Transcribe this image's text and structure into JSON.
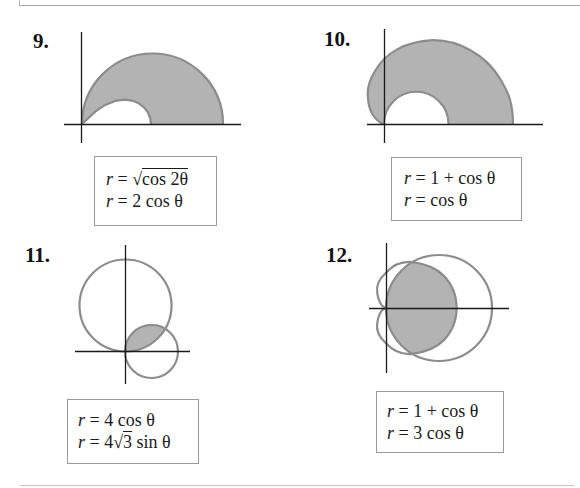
{
  "page": {
    "type": "textbook exercise figures: area between polar curves",
    "colors": {
      "curve": "#8c8c8c",
      "shading": "#b3b3b3",
      "axis": "#1a1a1a",
      "box_border": "#9a9a9a"
    }
  },
  "problems": [
    {
      "number": "9.",
      "equations": [
        {
          "lhs": "r",
          "eq": " = ",
          "pre": "",
          "radicand": "cos 2θ",
          "post": ""
        },
        {
          "lhs": "r",
          "eq": " = ",
          "text": "2 cos θ"
        }
      ],
      "figure": "shaded region inside r = 2cosθ, outside r = √cos2θ, upper half-plane"
    },
    {
      "number": "10.",
      "equations": [
        {
          "lhs": "r",
          "eq": " = ",
          "text": "1 + cos θ"
        },
        {
          "lhs": "r",
          "eq": " = ",
          "text": "cos θ"
        }
      ],
      "figure": "shaded region inside cardioid r = 1 + cosθ, outside r = cosθ, upper half-plane"
    },
    {
      "number": "11.",
      "equations": [
        {
          "lhs": "r",
          "eq": " = ",
          "text": "4 cos θ"
        },
        {
          "lhs": "r",
          "eq": " = ",
          "pre": "4",
          "radicand": "3",
          "post": " sin θ"
        }
      ],
      "figure": "shaded lens common to both circles"
    },
    {
      "number": "12.",
      "equations": [
        {
          "lhs": "r",
          "eq": " = ",
          "text": "1 + cos θ"
        },
        {
          "lhs": "r",
          "eq": " = ",
          "text": "3 cos θ"
        }
      ],
      "figure": "shaded region inside both the cardioid and the circle"
    }
  ]
}
